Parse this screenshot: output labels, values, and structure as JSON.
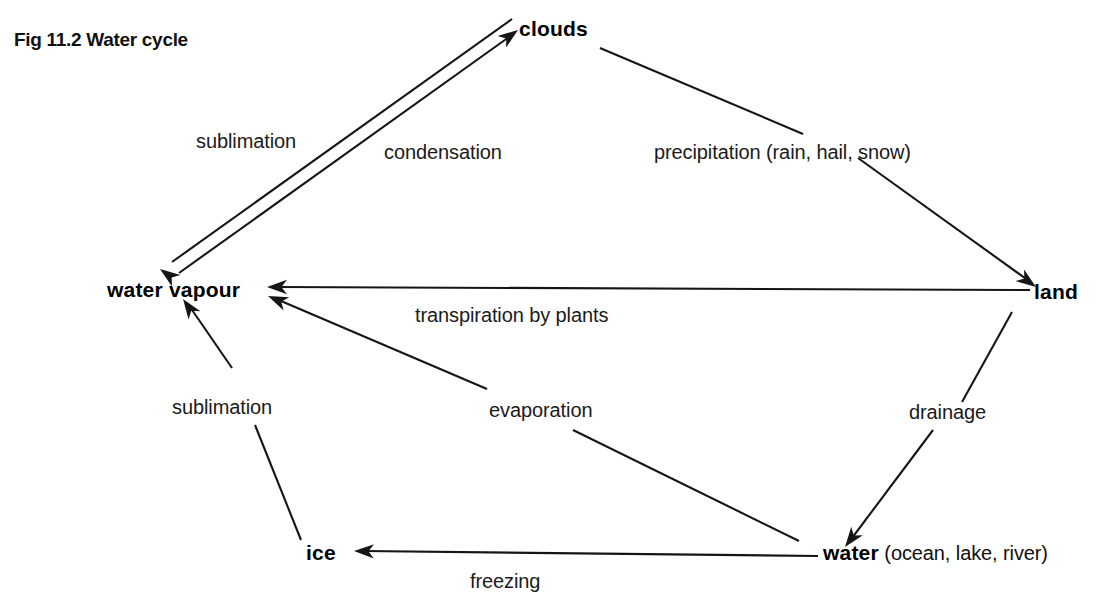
{
  "figure": {
    "caption": "Fig 11.2  Water cycle",
    "caption_x": 14,
    "caption_y": 46,
    "background": "#ffffff",
    "ink_color": "#151515"
  },
  "nodes": [
    {
      "id": "clouds",
      "label": "clouds",
      "qualifier": "",
      "x": 519,
      "y": 36,
      "anchor": "start"
    },
    {
      "id": "water_vapour",
      "label": "water  vapour",
      "qualifier": "",
      "x": 107,
      "y": 297,
      "anchor": "start"
    },
    {
      "id": "land",
      "label": "land",
      "qualifier": "",
      "x": 1034,
      "y": 299,
      "anchor": "start"
    },
    {
      "id": "ice",
      "label": "ice",
      "qualifier": "",
      "x": 306,
      "y": 560,
      "anchor": "start"
    },
    {
      "id": "water",
      "label": "water",
      "qualifier": " (ocean, lake, river)",
      "x": 823,
      "y": 560,
      "anchor": "start"
    }
  ],
  "edges": [
    {
      "id": "sublimation-clouds-to-vapour",
      "label": "sublimation",
      "from": "clouds",
      "to": "water_vapour",
      "label_x": 196,
      "label_y": 148,
      "segments": [
        [
          512,
          19,
          172,
          262
        ]
      ],
      "arrow": {
        "x": 160,
        "y": 269,
        "angle": 216
      }
    },
    {
      "id": "condensation-vapour-to-clouds",
      "label": "condensation",
      "from": "water_vapour",
      "to": "clouds",
      "label_x": 384,
      "label_y": 159,
      "segments": [
        [
          179,
          273,
          509,
          37
        ]
      ],
      "arrow": {
        "x": 518,
        "y": 30,
        "angle": 324
      }
    },
    {
      "id": "precipitation-clouds-to-land",
      "label": "precipitation  (rain, hail, snow)",
      "from": "clouds",
      "to": "land",
      "label_x": 654,
      "label_y": 159,
      "segments": [
        [
          600,
          48,
          803,
          134
        ],
        [
          858,
          158,
          1029,
          281
        ]
      ],
      "arrow": {
        "x": 1036,
        "y": 287,
        "angle": 36
      }
    },
    {
      "id": "transpiration-land-to-vapour",
      "label": "transpiration  by  plants",
      "from": "land",
      "to": "water_vapour",
      "label_x": 415,
      "label_y": 322,
      "segments": [
        [
          1030,
          290,
          277,
          287
        ]
      ],
      "arrow": {
        "x": 267,
        "y": 287,
        "angle": 180
      }
    },
    {
      "id": "drainage-land-to-water",
      "label": "drainage",
      "from": "land",
      "to": "water",
      "label_x": 909,
      "label_y": 419,
      "segments": [
        [
          1012,
          312,
          962,
          402
        ],
        [
          933,
          430,
          852,
          538
        ]
      ],
      "arrow": {
        "x": 845,
        "y": 547,
        "angle": 127
      }
    },
    {
      "id": "evaporation-water-to-vapour",
      "label": "evaporation",
      "from": "water",
      "to": "water_vapour",
      "label_x": 489,
      "label_y": 417,
      "segments": [
        [
          799,
          541,
          573,
          430
        ],
        [
          487,
          389,
          281,
          301
        ]
      ],
      "arrow": {
        "x": 268,
        "y": 296,
        "angle": 203
      }
    },
    {
      "id": "freezing-water-to-ice",
      "label": "freezing",
      "from": "water",
      "to": "ice",
      "label_x": 470,
      "label_y": 588,
      "segments": [
        [
          818,
          556,
          364,
          551
        ]
      ],
      "arrow": {
        "x": 354,
        "y": 551,
        "angle": 181
      }
    },
    {
      "id": "sublimation-ice-to-vapour",
      "label": "sublimation",
      "from": "ice",
      "to": "water_vapour",
      "label_x": 172,
      "label_y": 414,
      "segments": [
        [
          301,
          540,
          255,
          425
        ],
        [
          232,
          368,
          190,
          307
        ]
      ],
      "arrow": {
        "x": 183,
        "y": 299,
        "angle": 235
      }
    }
  ]
}
